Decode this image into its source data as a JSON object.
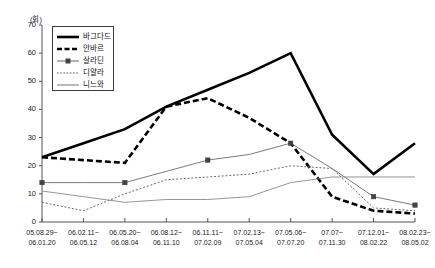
{
  "chart_data": {
    "type": "line",
    "title": "",
    "xlabel": "",
    "ylabel": "(회)",
    "ylim": [
      0,
      70
    ],
    "ytick_step": 10,
    "yticks": [
      0,
      10,
      20,
      30,
      40,
      50,
      60,
      70
    ],
    "grid": false,
    "legend_position": "top-left-inside",
    "categories": [
      "05.08.29~\n06.01.20",
      "06.02.11~\n06.05.12",
      "06.05.20~\n06.08.04",
      "06.08.12~\n06.11.10",
      "06.11.11~\n07.02.09",
      "07.02.13~\n07.05.04",
      "07.05.06~\n07.07.20",
      "07.07~\n07.11.30",
      "07.12.01~\n08.02.22",
      "08.02.23~\n08.05.02"
    ],
    "categories_line1": [
      "05.08.29~",
      "06.02.11~",
      "06.05.20~",
      "06.08.12~",
      "06.11.11~",
      "07.02.13~",
      "07.05.06~",
      "07.07~",
      "07.12.01~",
      "08.02.23~"
    ],
    "categories_line2": [
      "06.01.20",
      "06.05.12",
      "06.08.04",
      "06.11.10",
      "07.02.09",
      "07.05.04",
      "07.07.20",
      "07.11.30",
      "08.02.22",
      "08.05.02"
    ],
    "series": [
      {
        "name": "바그다드",
        "style": "thick-solid",
        "color": "#000000",
        "values": [
          23,
          28,
          33,
          41,
          47,
          53,
          60,
          31,
          17,
          28
        ]
      },
      {
        "name": "안바르",
        "style": "thick-dashed",
        "color": "#000000",
        "values": [
          23,
          22,
          21,
          41,
          44,
          37,
          28,
          9,
          4,
          3
        ]
      },
      {
        "name": "살라딘",
        "style": "thin-solid-square-markers",
        "color": "#6b6b6b",
        "values": [
          14,
          14,
          14,
          18,
          22,
          24,
          28,
          19,
          9,
          6
        ]
      },
      {
        "name": "디얄라",
        "style": "dotted",
        "color": "#6b6b6b",
        "values": [
          7,
          4,
          10,
          15,
          16,
          17,
          20,
          19,
          5,
          4
        ]
      },
      {
        "name": "니느와",
        "style": "thin-solid",
        "color": "#8a8a8a",
        "values": [
          11,
          9,
          7,
          8,
          8,
          9,
          14,
          16,
          16,
          16
        ]
      }
    ]
  },
  "legend": {
    "items": [
      {
        "label": "바그다드"
      },
      {
        "label": "안바르"
      },
      {
        "label": "살라딘"
      },
      {
        "label": "디얄라"
      },
      {
        "label": "니느와"
      }
    ]
  }
}
